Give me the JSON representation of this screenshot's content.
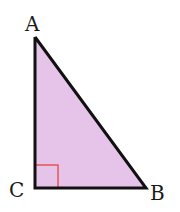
{
  "diagram": {
    "type": "right-triangle",
    "fill_color": "#e6c4ea",
    "stroke_color": "#111111",
    "right_angle_marker_color": "#e8535a",
    "background": "#ffffff",
    "vertices": {
      "A": {
        "label": "A",
        "x": 35,
        "y": 37
      },
      "B": {
        "label": "B",
        "x": 146,
        "y": 188
      },
      "C": {
        "label": "C",
        "x": 35,
        "y": 188
      }
    },
    "right_angle_at": "C",
    "labels": {
      "A": "A",
      "B": "B",
      "C": "C"
    }
  }
}
